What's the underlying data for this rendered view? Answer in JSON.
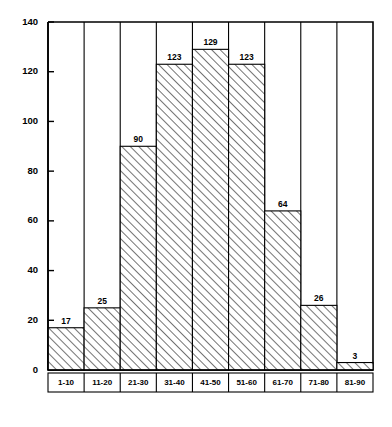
{
  "chart_data": {
    "type": "bar",
    "title": "",
    "subtitle": "",
    "xlabel": "",
    "ylabel": "",
    "categories": [
      "1-10",
      "11-20",
      "21-30",
      "31-40",
      "41-50",
      "51-60",
      "61-70",
      "71-80",
      "81-90"
    ],
    "values": [
      17,
      25,
      90,
      123,
      129,
      123,
      64,
      26,
      3
    ],
    "value_labels": [
      "17",
      "25",
      "90",
      "123",
      "129",
      "123",
      "64",
      "26",
      "3"
    ],
    "ylim": [
      0,
      140
    ],
    "y_ticks": [
      0,
      20,
      40,
      60,
      80,
      100,
      120,
      140
    ],
    "y_tick_labels": [
      "0",
      "20",
      "40",
      "60",
      "80",
      "100",
      "120",
      "140"
    ],
    "grid": false,
    "legend": null,
    "legend_position": "none",
    "bar_fill": "diagonal-hatch",
    "bar_outline_color": "#000000",
    "background_color": "#ffffff",
    "annotations": []
  },
  "figure": {
    "plot_left": 48,
    "plot_right": 373,
    "plot_top": 22,
    "plot_baseline": 370,
    "label_row_bottom": 392
  }
}
